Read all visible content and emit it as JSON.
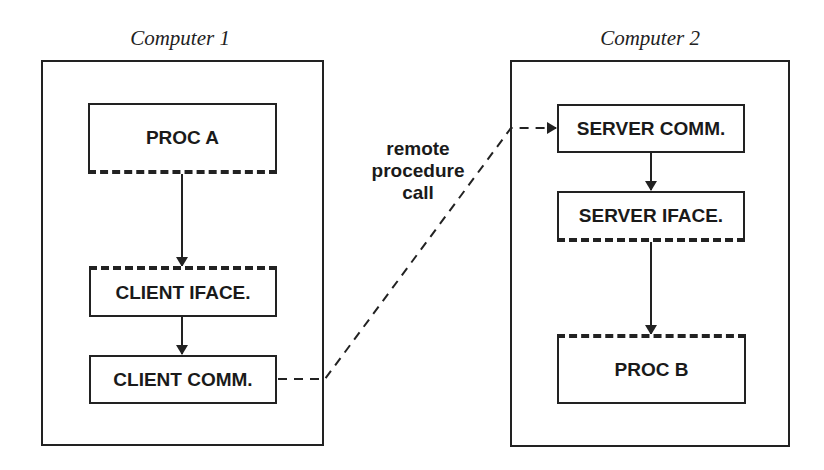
{
  "computers": [
    {
      "title": "Computer 1",
      "components": [
        {
          "label": "PROC A",
          "dashed_edge": "bottom"
        },
        {
          "label": "CLIENT IFACE.",
          "dashed_edge": "top"
        },
        {
          "label": "CLIENT COMM.",
          "dashed_edge": "none"
        }
      ]
    },
    {
      "title": "Computer 2",
      "components": [
        {
          "label": "SERVER COMM.",
          "dashed_edge": "none"
        },
        {
          "label": "SERVER IFACE.",
          "dashed_edge": "bottom"
        },
        {
          "label": "PROC B",
          "dashed_edge": "top"
        }
      ]
    }
  ],
  "connection": {
    "label_lines": [
      "remote",
      "procedure",
      "call"
    ],
    "from": "CLIENT COMM.",
    "to": "SERVER COMM.",
    "style": "dashed"
  },
  "colors": {
    "line": "#222222",
    "background": "#ffffff"
  }
}
